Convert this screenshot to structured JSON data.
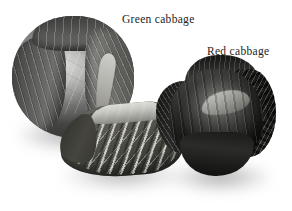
{
  "figure": {
    "type": "photograph",
    "background_color": "#ffffff",
    "rendering": "grayscale",
    "width": 292,
    "height": 211
  },
  "labels": [
    {
      "id": "green-cabbage",
      "text": "Green cabbage",
      "color": "#1c1c1c",
      "x": 122,
      "y": 14
    },
    {
      "id": "red-cabbage",
      "text": "Red cabbage",
      "color": "#1c1c1c",
      "x": 207,
      "y": 46
    }
  ],
  "objects": [
    {
      "id": "green-cabbage-head",
      "name": "Green cabbage",
      "position": "upper left",
      "description": "Round cabbage head with pale inner core and dark ribbed outer leaves"
    },
    {
      "id": "cut-wedge",
      "name": "Cut cabbage wedge",
      "position": "lower center",
      "description": "Sectioned cabbage showing pale internal rib fan against darker leaf tissue"
    },
    {
      "id": "red-cabbage-head",
      "name": "Red cabbage",
      "position": "right",
      "description": "Dark head with frilly crinkled outer leaves and a bright highlight band"
    }
  ]
}
